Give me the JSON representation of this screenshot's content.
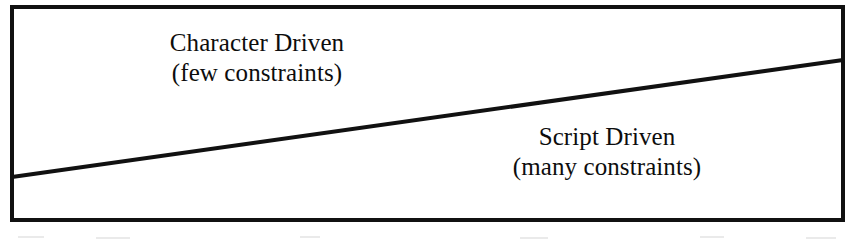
{
  "figure": {
    "kind": "continuum-diagram",
    "background_color": "#ffffff",
    "ink_color": "#111111"
  },
  "frame": {
    "name": "diagram-border",
    "x": 10,
    "y": 5,
    "width": 835,
    "height": 217,
    "stroke_width": 4,
    "stroke_color": "#111111"
  },
  "divider": {
    "name": "diagonal-divider-line",
    "x1": 12,
    "y1": 177,
    "x2": 843,
    "y2": 60,
    "stroke_width": 4,
    "stroke_color": "#111111"
  },
  "labels": {
    "upper_left": {
      "title": "Character Driven",
      "subtitle": "(few constraints)"
    },
    "lower_right": {
      "title": "Script Driven",
      "subtitle": "(many constraints)"
    }
  },
  "chart_data": {
    "type": "diagram",
    "title": "",
    "subtitle": "",
    "xlabel": "",
    "ylabel": "",
    "regions": [
      {
        "name": "upper-left-region",
        "label": "Character Driven",
        "sublabel": "(few constraints)",
        "position": "above the diagonal"
      },
      {
        "name": "lower-right-region",
        "label": "Script Driven",
        "sublabel": "(many constraints)",
        "position": "below the diagonal"
      }
    ],
    "divider_endpoints": [
      [
        12,
        177
      ],
      [
        843,
        60
      ]
    ],
    "grid": false,
    "legend": "none"
  }
}
